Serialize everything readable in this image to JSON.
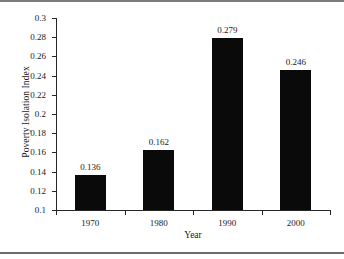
{
  "chart_data": {
    "type": "bar",
    "title": "",
    "xlabel": "Year",
    "ylabel": "Poverty Isolation Index",
    "categories": [
      "1970",
      "1980",
      "1990",
      "2000"
    ],
    "values": [
      0.136,
      0.162,
      0.279,
      0.246
    ],
    "value_labels": [
      "0.136",
      "0.162",
      "0.279",
      "0.246"
    ],
    "ylim": [
      0.1,
      0.3
    ],
    "ytick_step": 0.02,
    "ytick_labels": [
      "0.3",
      "0.28",
      "0.26",
      "0.24",
      "0.22",
      "0.2",
      "0.18",
      "0.16",
      "0.14",
      "0.12",
      "0.1"
    ],
    "ytick_values": [
      0.3,
      0.28,
      0.26,
      0.24,
      0.22,
      0.2,
      0.18,
      0.16,
      0.14,
      0.12,
      0.1
    ],
    "grid": false,
    "legend": false,
    "bar_color": "#0a0a0a",
    "axis_color": "#262626",
    "background_color": "#ffffff"
  }
}
